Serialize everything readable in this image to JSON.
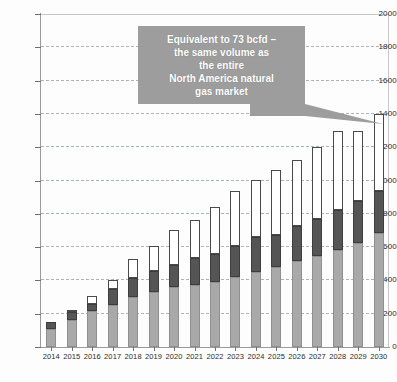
{
  "chart_data": {
    "type": "bar",
    "subtype": "stacked-column",
    "title": "",
    "subtitle": "",
    "xlabel": "",
    "ylabel": "",
    "ylim": [
      0,
      2000
    ],
    "ytick_step": 200,
    "yticks": [
      0,
      200,
      400,
      600,
      800,
      1000,
      1200,
      1400,
      1600,
      1800,
      2000
    ],
    "ytick_labels": [
      "0",
      "200",
      "400",
      "600",
      "800",
      "1000",
      "1200",
      "1400",
      "1600",
      "1800",
      "2000"
    ],
    "grid": true,
    "grid_style": "dashed-horizontal",
    "legend": false,
    "legend_position": "none",
    "categories": [
      "2014",
      "2015",
      "2016",
      "2017",
      "2018",
      "2019",
      "2020",
      "2021",
      "2022",
      "2023",
      "2024",
      "2025",
      "2026",
      "2027",
      "2028",
      "2029",
      "2030"
    ],
    "series": [
      {
        "name": "base-segment",
        "color": "#a9a9a9",
        "values": [
          110,
          160,
          215,
          255,
          300,
          330,
          360,
          375,
          390,
          420,
          450,
          480,
          515,
          545,
          580,
          625,
          685
        ]
      },
      {
        "name": "middle-segment",
        "color": "#555555",
        "values": [
          40,
          50,
          45,
          95,
          115,
          125,
          135,
          160,
          170,
          185,
          210,
          195,
          210,
          225,
          245,
          250,
          250
        ]
      },
      {
        "name": "top-segment",
        "color": "#ffffff",
        "values": [
          0,
          10,
          45,
          55,
          115,
          150,
          205,
          225,
          280,
          330,
          345,
          390,
          400,
          430,
          475,
          425,
          465
        ]
      }
    ],
    "totals": [
      150,
      220,
      305,
      405,
      530,
      605,
      700,
      760,
      840,
      935,
      1005,
      1065,
      1125,
      1200,
      1300,
      1300,
      1400
    ]
  },
  "annotations": {
    "callout": {
      "text": "Equivalent to 73 bcfd –\nthe same volume as\nthe entire\nNorth America natural\ngas market",
      "background_color": "#9d9d9d",
      "text_color": "#ffffff",
      "points_to_category": "2030"
    }
  },
  "colors": {
    "base_fill": "#a9a9a9",
    "middle_fill": "#555555",
    "top_fill": "#ffffff",
    "bar_stroke": "#4a4a4a",
    "grid": "#9fa6ae",
    "axis": "#9a9a9a",
    "text": "#2b2b2b"
  }
}
